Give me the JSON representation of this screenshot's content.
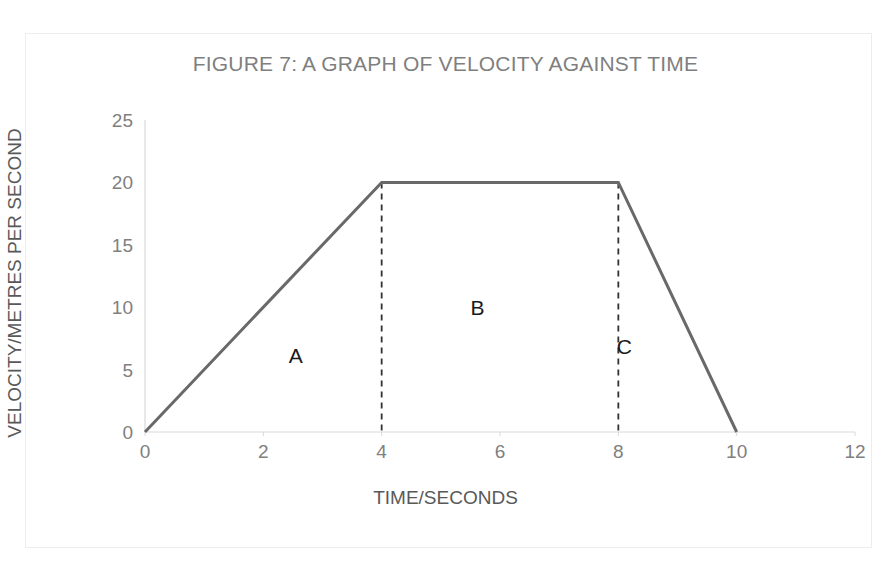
{
  "chart_data": {
    "type": "line",
    "title": "FIGURE 7: A GRAPH OF VELOCITY AGAINST TIME",
    "xlabel": "TIME/SECONDS",
    "ylabel": "VELOCITY/METRES PER SECOND",
    "xlim": [
      0,
      12
    ],
    "ylim": [
      0,
      25
    ],
    "xticks": [
      0,
      2,
      4,
      6,
      8,
      10,
      12
    ],
    "yticks": [
      0,
      5,
      10,
      15,
      20,
      25
    ],
    "xtick_labels": [
      "0",
      "2",
      "4",
      "6",
      "8",
      "10",
      "12"
    ],
    "ytick_labels": [
      "0",
      "5",
      "10",
      "15",
      "20",
      "25"
    ],
    "grid": false,
    "legend": false,
    "series": [
      {
        "name": "velocity",
        "x": [
          0,
          4,
          8,
          10
        ],
        "y": [
          0,
          20,
          20,
          0
        ],
        "color": "#696969",
        "linewidth": 3
      }
    ],
    "droplines": [
      {
        "x": 4,
        "y_top": 20,
        "y_bottom": 0,
        "style": "dashed",
        "color": "#333333"
      },
      {
        "x": 8,
        "y_top": 20,
        "y_bottom": 0,
        "style": "dashed",
        "color": "#333333"
      }
    ],
    "annotations": [
      {
        "label": "A",
        "x": 2.55,
        "y": 6.2
      },
      {
        "label": "B",
        "x": 5.62,
        "y": 10.0
      },
      {
        "label": "C",
        "x": 8.1,
        "y": 6.9
      }
    ],
    "axis_color": "#d9d9d9",
    "title_color": "#7f7f7f",
    "tick_label_color": "#808080",
    "axis_title_color": "#595959",
    "background": "#ffffff",
    "frame_color": "#ededee"
  }
}
